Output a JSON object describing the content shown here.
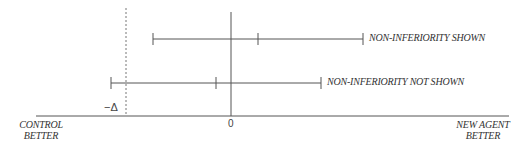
{
  "diagram": {
    "type": "non-inferiority confidence interval diagram",
    "axis": {
      "zero_label": "0",
      "margin_label": "−Δ",
      "left_label_line1": "CONTROL",
      "left_label_line2": "BETTER",
      "right_label_line1": "NEW AGENT",
      "right_label_line2": "BETTER"
    },
    "intervals": [
      {
        "label": "NON-INFERIORITY SHOWN",
        "lower_px": 153,
        "point_px": 258,
        "upper_px": 363,
        "y_px": 39
      },
      {
        "label": "NON-INFERIORITY NOT SHOWN",
        "lower_px": 111,
        "point_px": 216,
        "upper_px": 321,
        "y_px": 83
      }
    ],
    "colors": {
      "line": "#555555",
      "text": "#333333"
    }
  }
}
